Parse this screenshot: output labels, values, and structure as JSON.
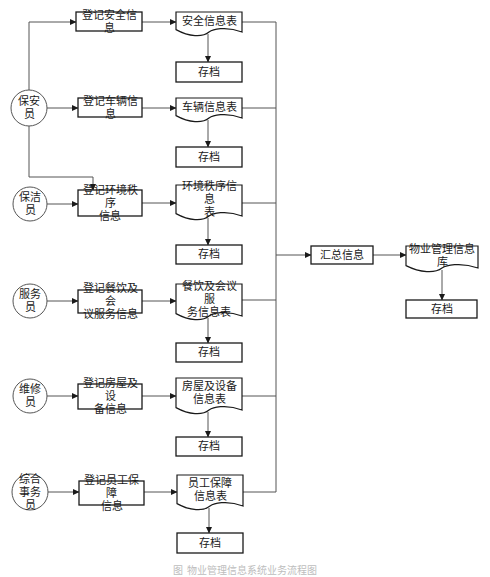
{
  "diagram": {
    "colors": {
      "stroke": "#1a1a1a",
      "line": "#555555",
      "text": "#1a1a1a"
    },
    "actors": [
      {
        "id": "a1",
        "label": "保安员",
        "cx": 29,
        "cy": 108,
        "r": 18
      },
      {
        "id": "a2",
        "label": "保洁员",
        "cx": 30,
        "cy": 204,
        "r": 17
      },
      {
        "id": "a3",
        "label": "服务员",
        "cx": 30,
        "cy": 301,
        "r": 17
      },
      {
        "id": "a4",
        "label": "维修员",
        "cx": 30,
        "cy": 396,
        "r": 17
      },
      {
        "id": "a5",
        "label": "综合\n事务员",
        "cx": 30,
        "cy": 492,
        "r": 18
      }
    ],
    "processes": [
      {
        "id": "p1",
        "label": "登记安全信息",
        "x": 76,
        "y": 12,
        "w": 66,
        "h": 19
      },
      {
        "id": "p2",
        "label": "登记车辆信息",
        "x": 78,
        "y": 98,
        "w": 64,
        "h": 19
      },
      {
        "id": "p3",
        "label": "登记环境秩序\n信息",
        "x": 78,
        "y": 190,
        "w": 64,
        "h": 26
      },
      {
        "id": "p4",
        "label": "登记餐饮及会\n议服务信息",
        "x": 78,
        "y": 290,
        "w": 64,
        "h": 23
      },
      {
        "id": "p5",
        "label": "登记房屋及设\n备信息",
        "x": 78,
        "y": 384,
        "w": 64,
        "h": 25
      },
      {
        "id": "p6",
        "label": "登记员工保障\n信息",
        "x": 79,
        "y": 481,
        "w": 65,
        "h": 24
      },
      {
        "id": "p7",
        "label": "汇总信息",
        "x": 311,
        "y": 246,
        "w": 62,
        "h": 18
      }
    ],
    "documents": [
      {
        "id": "d1",
        "label": "安全信息表",
        "x": 176,
        "y": 12,
        "w": 66,
        "h": 24
      },
      {
        "id": "d2",
        "label": "车辆信息表",
        "x": 176,
        "y": 98,
        "w": 66,
        "h": 24
      },
      {
        "id": "d3",
        "label": "环境秩序信息\n表",
        "x": 176,
        "y": 185,
        "w": 66,
        "h": 35
      },
      {
        "id": "d4",
        "label": "餐饮及会议服\n务信息表",
        "x": 176,
        "y": 284,
        "w": 66,
        "h": 36
      },
      {
        "id": "d5",
        "label": "房屋及设备\n信息表",
        "x": 176,
        "y": 378,
        "w": 66,
        "h": 36
      },
      {
        "id": "d6",
        "label": "员工保障\n信息表",
        "x": 177,
        "y": 475,
        "w": 66,
        "h": 35
      },
      {
        "id": "d7",
        "label": "物业管理信息库",
        "x": 406,
        "y": 246,
        "w": 72,
        "h": 26
      }
    ],
    "archives": [
      {
        "id": "s1",
        "label": "存档",
        "x": 176,
        "y": 62,
        "w": 66,
        "h": 20
      },
      {
        "id": "s2",
        "label": "存档",
        "x": 176,
        "y": 147,
        "w": 66,
        "h": 20
      },
      {
        "id": "s3",
        "label": "存档",
        "x": 176,
        "y": 245,
        "w": 66,
        "h": 19
      },
      {
        "id": "s4",
        "label": "存档",
        "x": 176,
        "y": 343,
        "w": 66,
        "h": 19
      },
      {
        "id": "s5",
        "label": "存档",
        "x": 176,
        "y": 437,
        "w": 66,
        "h": 19
      },
      {
        "id": "s6",
        "label": "存档",
        "x": 177,
        "y": 533,
        "w": 66,
        "h": 20
      },
      {
        "id": "s7",
        "label": "存档",
        "x": 406,
        "y": 300,
        "w": 71,
        "h": 18
      }
    ],
    "arrows": [
      {
        "points": [
          [
            29,
            90
          ],
          [
            29,
            22
          ],
          [
            76,
            22
          ]
        ],
        "arrow": true
      },
      {
        "points": [
          [
            47,
            108
          ],
          [
            78,
            108
          ]
        ],
        "arrow": true
      },
      {
        "points": [
          [
            29,
            126
          ],
          [
            29,
            177
          ],
          [
            93,
            177
          ],
          [
            93,
            190
          ]
        ],
        "arrow": true
      },
      {
        "points": [
          [
            47,
            204
          ],
          [
            78,
            204
          ]
        ],
        "arrow": true
      },
      {
        "points": [
          [
            47,
            301
          ],
          [
            78,
            301
          ]
        ],
        "arrow": true
      },
      {
        "points": [
          [
            47,
            396
          ],
          [
            78,
            396
          ]
        ],
        "arrow": true
      },
      {
        "points": [
          [
            48,
            492
          ],
          [
            79,
            492
          ]
        ],
        "arrow": true
      },
      {
        "points": [
          [
            142,
            22
          ],
          [
            176,
            22
          ]
        ],
        "arrow": true
      },
      {
        "points": [
          [
            142,
            108
          ],
          [
            176,
            108
          ]
        ],
        "arrow": true
      },
      {
        "points": [
          [
            142,
            203
          ],
          [
            176,
            203
          ]
        ],
        "arrow": true
      },
      {
        "points": [
          [
            142,
            301
          ],
          [
            176,
            301
          ]
        ],
        "arrow": true
      },
      {
        "points": [
          [
            142,
            396
          ],
          [
            176,
            396
          ]
        ],
        "arrow": true
      },
      {
        "points": [
          [
            144,
            492
          ],
          [
            177,
            492
          ]
        ],
        "arrow": true
      },
      {
        "points": [
          [
            208,
            34
          ],
          [
            208,
            62
          ]
        ],
        "arrow": true
      },
      {
        "points": [
          [
            208,
            120
          ],
          [
            208,
            147
          ]
        ],
        "arrow": true
      },
      {
        "points": [
          [
            208,
            218
          ],
          [
            208,
            245
          ]
        ],
        "arrow": true
      },
      {
        "points": [
          [
            208,
            318
          ],
          [
            208,
            343
          ]
        ],
        "arrow": true
      },
      {
        "points": [
          [
            208,
            412
          ],
          [
            208,
            437
          ]
        ],
        "arrow": true
      },
      {
        "points": [
          [
            209,
            508
          ],
          [
            209,
            533
          ]
        ],
        "arrow": true
      },
      {
        "points": [
          [
            242,
            22
          ],
          [
            276,
            22
          ],
          [
            276,
            492
          ],
          [
            243,
            492
          ]
        ],
        "arrow": false
      },
      {
        "points": [
          [
            242,
            108
          ],
          [
            276,
            108
          ]
        ],
        "arrow": false
      },
      {
        "points": [
          [
            242,
            203
          ],
          [
            276,
            203
          ]
        ],
        "arrow": false
      },
      {
        "points": [
          [
            242,
            300
          ],
          [
            276,
            300
          ]
        ],
        "arrow": false
      },
      {
        "points": [
          [
            242,
            396
          ],
          [
            276,
            396
          ]
        ],
        "arrow": false
      },
      {
        "points": [
          [
            276,
            255
          ],
          [
            311,
            255
          ]
        ],
        "arrow": true
      },
      {
        "points": [
          [
            373,
            255
          ],
          [
            406,
            255
          ]
        ],
        "arrow": true
      },
      {
        "points": [
          [
            442,
            270
          ],
          [
            442,
            300
          ]
        ],
        "arrow": true
      }
    ]
  },
  "caption": "图 物业管理信息系统业务流程图"
}
